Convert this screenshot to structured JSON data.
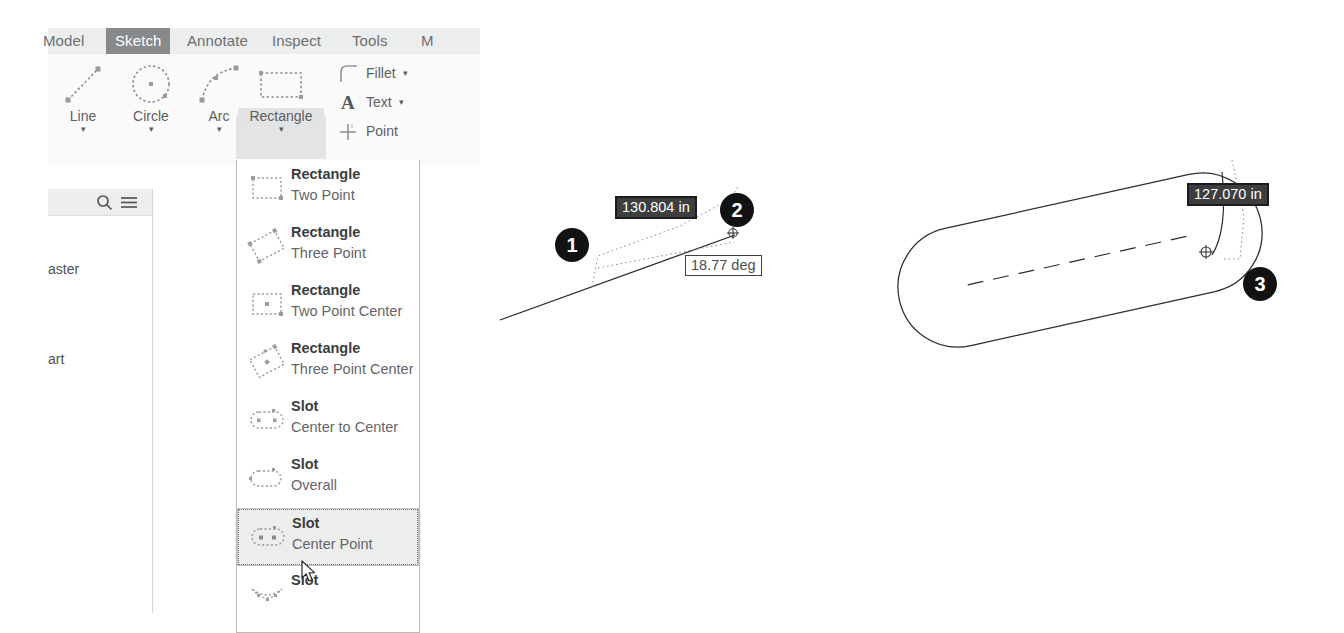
{
  "app": {
    "name": "Autodesk Inventor Sketch",
    "accent_selected_tab": "#88898b",
    "dim_field_active_bg": "#3d3e40"
  },
  "ribbon": {
    "tabs": [
      {
        "label": "Model",
        "active": false
      },
      {
        "label": "Sketch",
        "active": true
      },
      {
        "label": "Annotate",
        "active": false
      },
      {
        "label": "Inspect",
        "active": false
      },
      {
        "label": "Tools",
        "active": false
      },
      {
        "label": "M",
        "active": false
      }
    ],
    "buttons": [
      {
        "label": "Line",
        "icon": "line-icon",
        "caret": "▾"
      },
      {
        "label": "Circle",
        "icon": "circle-icon",
        "caret": "▾"
      },
      {
        "label": "Arc",
        "icon": "arc-icon",
        "caret": "▾"
      },
      {
        "label": "Rectangle",
        "icon": "rectangle-icon",
        "caret": "▾"
      }
    ],
    "small_buttons": [
      {
        "label": "Fillet",
        "icon": "fillet-icon",
        "caret": "▾"
      },
      {
        "label": "Text",
        "icon": "text-icon",
        "caret": "▾"
      },
      {
        "label": "Point",
        "icon": "point-icon",
        "caret": ""
      }
    ]
  },
  "browser": {
    "search_icon": "search-icon",
    "menu_icon": "hamburger-menu-icon",
    "nodes": [
      {
        "label": "aster"
      },
      {
        "label": "art"
      }
    ]
  },
  "dropdown": {
    "items": [
      {
        "title": "Rectangle",
        "subtitle": "Two Point",
        "icon": "rectangle-two-point-icon",
        "selected": false
      },
      {
        "title": "Rectangle",
        "subtitle": "Three Point",
        "icon": "rectangle-three-point-icon",
        "selected": false
      },
      {
        "title": "Rectangle",
        "subtitle": "Two Point Center",
        "icon": "rectangle-two-point-center-icon",
        "selected": false
      },
      {
        "title": "Rectangle",
        "subtitle": "Three Point Center",
        "icon": "rectangle-three-point-center-icon",
        "selected": false
      },
      {
        "title": "Slot",
        "subtitle": "Center to Center",
        "icon": "slot-center-to-center-icon",
        "selected": false
      },
      {
        "title": "Slot",
        "subtitle": "Overall",
        "icon": "slot-overall-icon",
        "selected": false
      },
      {
        "title": "Slot",
        "subtitle": "Center Point",
        "icon": "slot-center-point-icon",
        "selected": true
      },
      {
        "title": "Slot",
        "subtitle": "",
        "icon": "slot-arc-icon",
        "selected": false
      }
    ]
  },
  "canvas": {
    "callouts": [
      {
        "number": "1"
      },
      {
        "number": "2"
      },
      {
        "number": "3"
      }
    ],
    "dimensions": [
      {
        "value": "130.804 in",
        "state": "active"
      },
      {
        "value": "18.77 deg",
        "state": "plain"
      },
      {
        "value": "127.070 in",
        "state": "active"
      }
    ]
  }
}
